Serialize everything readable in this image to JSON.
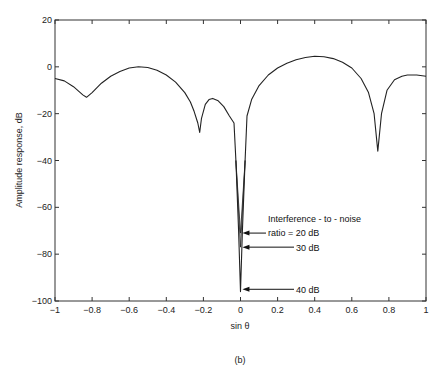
{
  "chart_data": {
    "type": "line",
    "title": "",
    "caption": "(b)",
    "xlabel": "sin θ",
    "ylabel": "Amplitude response, dB",
    "xlim": [
      -1,
      1
    ],
    "ylim": [
      -100,
      20
    ],
    "grid": false,
    "xticks": [
      -1,
      -0.8,
      -0.6,
      -0.4,
      -0.2,
      0,
      0.2,
      0.4,
      0.6,
      0.8,
      1
    ],
    "xtick_labels": [
      "-1",
      "-0.8",
      "-0.6",
      "-0.4",
      "-0.2",
      "0",
      "0.2",
      "0.4",
      "0.6",
      "0.8",
      "1"
    ],
    "yticks": [
      20,
      0,
      -20,
      -40,
      -60,
      -80,
      -100
    ],
    "ytick_labels": [
      "20",
      "0",
      "-20",
      "-40",
      "-60",
      "-80",
      "-100"
    ],
    "series": [
      {
        "name": "Amplitude response",
        "x": [
          -1,
          -0.95,
          -0.9,
          -0.85,
          -0.83,
          -0.8,
          -0.75,
          -0.7,
          -0.65,
          -0.6,
          -0.55,
          -0.5,
          -0.45,
          -0.4,
          -0.35,
          -0.3,
          -0.27,
          -0.25,
          -0.23,
          -0.22,
          -0.21,
          -0.19,
          -0.17,
          -0.15,
          -0.12,
          -0.09,
          -0.06,
          -0.035,
          -0.025,
          -0.01,
          0,
          0.01,
          0.025,
          0.035,
          0.06,
          0.1,
          0.15,
          0.2,
          0.25,
          0.3,
          0.35,
          0.4,
          0.45,
          0.5,
          0.55,
          0.6,
          0.65,
          0.69,
          0.72,
          0.74,
          0.76,
          0.79,
          0.83,
          0.87,
          0.9,
          0.95,
          1
        ],
        "values": [
          -5,
          -6,
          -8.5,
          -12,
          -13,
          -11,
          -7,
          -4,
          -2,
          -0.5,
          0,
          -0.3,
          -1.5,
          -3.5,
          -6.5,
          -11,
          -15,
          -19,
          -24,
          -28,
          -22,
          -16,
          -14,
          -13.5,
          -14.5,
          -17,
          -21,
          -24,
          -40,
          -70,
          -96,
          -70,
          -40,
          -21,
          -14,
          -8,
          -3.5,
          -0.5,
          1.5,
          3,
          4,
          4.5,
          4.3,
          3.5,
          2,
          -0.5,
          -5,
          -11,
          -20,
          -36,
          -20,
          -10,
          -5.5,
          -4,
          -3.5,
          -3.5,
          -4
        ]
      }
    ],
    "annotations": [
      {
        "text": "Interference - to - noise",
        "x": 0.18,
        "y": -66
      },
      {
        "text": "ratio = 20 dB",
        "x": 0.18,
        "y": -71,
        "arrow_to": [
          0.005,
          -71
        ]
      },
      {
        "text": "30 dB",
        "x": 0.38,
        "y": -77,
        "arrow_to": [
          0.005,
          -77
        ]
      },
      {
        "text": "40 dB",
        "x": 0.38,
        "y": -95,
        "arrow_to": [
          0.005,
          -95
        ]
      }
    ]
  },
  "labels": {
    "xlabel": "sin θ",
    "ylabel": "Amplitude response, dB",
    "caption": "(b)",
    "annot_title": "Interference - to - noise",
    "annot_20": "ratio = 20 dB",
    "annot_30": "30 dB",
    "annot_40": "40 dB"
  }
}
